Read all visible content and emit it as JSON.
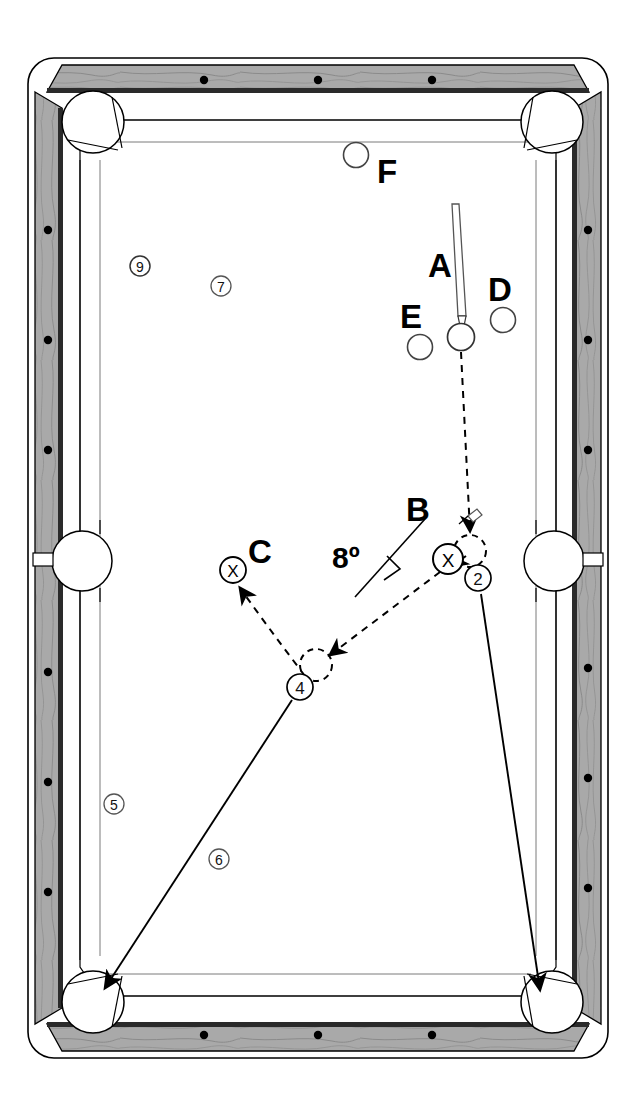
{
  "diagram": {
    "angle_annotation": "8º",
    "table": {
      "rail_color": "#a8a8a8",
      "cloth_color": "#ffffff",
      "line_color": "#000000",
      "pocket_count": 6,
      "diamond_count_top": 3,
      "diamond_count_bottom": 3,
      "diamond_count_left": 6,
      "diamond_count_right": 6
    },
    "ball_labels": [
      {
        "id": "A",
        "label": "A",
        "x": 461,
        "y": 337,
        "label_x": 440,
        "label_y": 277,
        "type": "cue"
      },
      {
        "id": "B",
        "label": "B",
        "x": 448,
        "y": 559,
        "label_x": 418,
        "label_y": 521,
        "type": "x-ball"
      },
      {
        "id": "C",
        "label": "C",
        "x": 233,
        "y": 570,
        "label_x": 260,
        "label_y": 563,
        "type": "x-ball"
      },
      {
        "id": "D",
        "label": "D",
        "x": 503,
        "y": 320,
        "label_x": 500,
        "label_y": 301,
        "type": "object"
      },
      {
        "id": "E",
        "label": "E",
        "x": 420,
        "y": 347,
        "label_x": 411,
        "label_y": 328,
        "type": "object"
      },
      {
        "id": "F",
        "label": "F",
        "x": 356,
        "y": 155,
        "label_x": 387,
        "label_y": 183,
        "type": "object"
      }
    ],
    "x_marks": [
      "X",
      "X"
    ],
    "position_markers": [
      {
        "number": "9",
        "x": 140,
        "y": 266
      },
      {
        "number": "7",
        "x": 221,
        "y": 286
      },
      {
        "number": "5",
        "x": 114,
        "y": 804
      },
      {
        "number": "6",
        "x": 219,
        "y": 859
      },
      {
        "number": "2",
        "x": 478,
        "y": 578
      },
      {
        "number": "4",
        "x": 300,
        "y": 687
      }
    ],
    "ghost_balls": [
      {
        "for": "2",
        "x": 470,
        "y": 551
      },
      {
        "for": "4",
        "x": 316,
        "y": 665
      }
    ],
    "cue_stick": {
      "tip_x": 461,
      "tip_y": 322,
      "butt_x": 456,
      "butt_y": 205
    },
    "paths": [
      {
        "name": "cue-ball-path",
        "style": "dashed",
        "from": "A",
        "to": "ghost-2"
      },
      {
        "name": "object-ball-2-path",
        "style": "solid",
        "from": "2",
        "to": "bottom-right-pocket"
      },
      {
        "name": "cue-deflect-path",
        "style": "dashed",
        "from": "B",
        "to": "ghost-4"
      },
      {
        "name": "object-ball-4-path",
        "style": "solid",
        "from": "4",
        "to": "bottom-left-pocket"
      },
      {
        "name": "cue-final-path",
        "style": "dashed",
        "from": "ghost-4",
        "to": "C"
      }
    ]
  }
}
